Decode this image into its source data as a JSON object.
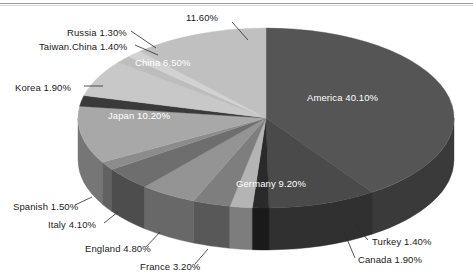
{
  "chart_data": {
    "type": "pie",
    "title": "",
    "subtitle": "",
    "xlabel": "",
    "ylabel": "",
    "legend_position": "none",
    "grid": false,
    "style": "3d-exploded-none",
    "unit": "%",
    "categories": [
      "America",
      "Germany",
      "Turkey",
      "Canada",
      "France",
      "England",
      "Italy",
      "Spanish",
      "Japan",
      "Korea",
      "China",
      "Taiwan.China",
      "Russia",
      ""
    ],
    "values": [
      40.1,
      9.2,
      1.4,
      1.9,
      3.2,
      4.8,
      4.1,
      1.5,
      10.2,
      1.9,
      6.5,
      1.4,
      1.3,
      11.6
    ],
    "labels": [
      "America 40.10%",
      "Germany 9.20%",
      "Turkey 1.40%",
      "Canada 1.90%",
      "France 3.20%",
      "England 4.80%",
      "Italy 4.10%",
      "Spanish 1.50%",
      "Japan 10.20%",
      "Korea 1.90%",
      "China 6.50%",
      "Taiwan.China 1.40%",
      "Russia 1.30%",
      "11.60%"
    ],
    "slice_colors": [
      "#555555",
      "#4a4a4a",
      "#2a2a2a",
      "#b4b4b4",
      "#7e7e7e",
      "#949494",
      "#6e6e6e",
      "#8c8c8c",
      "#a8a8a8",
      "#3a3a3a",
      "#c8c8c8",
      "#bdbdbd",
      "#d2d2d2",
      "#c0c0c0"
    ]
  },
  "slices": [
    {
      "name": "america",
      "label": "America 40.10%",
      "value": 40.1,
      "color": "#555555",
      "side": "#3a3a3a"
    },
    {
      "name": "germany",
      "label": "Germany 9.20%",
      "value": 9.2,
      "color": "#4a4a4a",
      "side": "#303030"
    },
    {
      "name": "turkey",
      "label": "Turkey 1.40%",
      "value": 1.4,
      "color": "#2a2a2a",
      "side": "#1a1a1a"
    },
    {
      "name": "canada",
      "label": "Canada 1.90%",
      "value": 1.9,
      "color": "#b4b4b4",
      "side": "#7d7d7d"
    },
    {
      "name": "france",
      "label": "France 3.20%",
      "value": 3.2,
      "color": "#7e7e7e",
      "side": "#585858"
    },
    {
      "name": "england",
      "label": "England 4.80%",
      "value": 4.8,
      "color": "#949494",
      "side": "#686868"
    },
    {
      "name": "italy",
      "label": "Italy 4.10%",
      "value": 4.1,
      "color": "#6e6e6e",
      "side": "#4d4d4d"
    },
    {
      "name": "spanish",
      "label": "Spanish 1.50%",
      "value": 1.5,
      "color": "#8c8c8c",
      "side": "#626262"
    },
    {
      "name": "japan",
      "label": "Japan 10.20%",
      "value": 10.2,
      "color": "#a8a8a8",
      "side": "#767676"
    },
    {
      "name": "korea",
      "label": "Korea 1.90%",
      "value": 1.9,
      "color": "#3a3a3a",
      "side": "#282828"
    },
    {
      "name": "china",
      "label": "China 6.50%",
      "value": 6.5,
      "color": "#c8c8c8",
      "side": "#8c8c8c"
    },
    {
      "name": "taiwan-china",
      "label": "Taiwan.China 1.40%",
      "value": 1.4,
      "color": "#bdbdbd",
      "side": "#848484"
    },
    {
      "name": "russia",
      "label": "Russia 1.30%",
      "value": 1.3,
      "color": "#d2d2d2",
      "side": "#939393"
    },
    {
      "name": "other",
      "label": "11.60%",
      "value": 11.6,
      "color": "#c0c0c0",
      "side": "#868686"
    }
  ],
  "callouts": {
    "russia": "Russia 1.30%",
    "taiwan_china": "Taiwan.China 1.40%",
    "korea": "Korea 1.90%",
    "spanish": "Spanish 1.50%",
    "italy": "Italy 4.10%",
    "england": "England 4.80%",
    "france": "France 3.20%",
    "turkey": "Turkey 1.40%",
    "canada": "Canada 1.90%",
    "other": "11.60%"
  },
  "inner_labels": {
    "america": "America 40.10%",
    "germany": "Germany 9.20%",
    "japan": "Japan 10.20%",
    "china": "China 6.50%"
  }
}
